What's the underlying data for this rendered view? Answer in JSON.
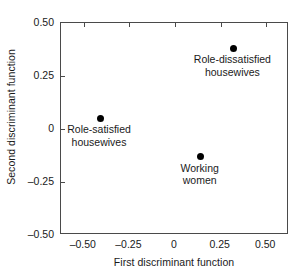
{
  "chart_data": {
    "type": "scatter",
    "title": "",
    "xlabel": "First discriminant function",
    "ylabel": "Second discriminant function",
    "xlim": [
      -0.625,
      0.625
    ],
    "ylim": [
      -0.5,
      0.5
    ],
    "xticks": [
      "-0.50",
      "-0.25",
      "0",
      "0.25",
      "0.50"
    ],
    "xtick_values": [
      -0.5,
      -0.25,
      0,
      0.25,
      0.5
    ],
    "yticks": [
      "0.50",
      "0.25",
      "0",
      "-0.25",
      "-0.50"
    ],
    "ytick_values": [
      0.5,
      0.25,
      0,
      -0.25,
      -0.5
    ],
    "grid": false,
    "legend": "none",
    "marker_color": "#000000",
    "axis_color": "#4a4a4a",
    "points": [
      {
        "label_line1": "Role-dissatisfied",
        "label_line2": "housewives",
        "x": 0.32,
        "y": 0.38,
        "label_position": "below"
      },
      {
        "label_line1": "Role-satisfied",
        "label_line2": "housewives",
        "x": -0.41,
        "y": 0.05,
        "label_position": "below"
      },
      {
        "label_line1": "Working",
        "label_line2": "women",
        "x": 0.14,
        "y": -0.13,
        "label_position": "below"
      }
    ]
  }
}
